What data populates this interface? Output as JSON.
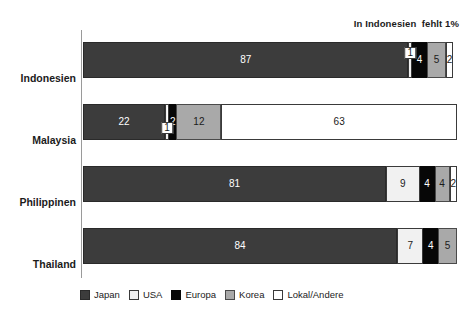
{
  "annotation": "In Indonesien  fehlt 1%",
  "chart_data": {
    "type": "bar",
    "orientation": "horizontal",
    "stacked": true,
    "title": "",
    "subtitle": "",
    "xlabel": "",
    "ylabel": "",
    "xlim": [
      0,
      100
    ],
    "grid": false,
    "legend_position": "bottom",
    "annotations": [
      "In Indonesien  fehlt 1%"
    ],
    "categories": [
      "Indonesien",
      "Malaysia",
      "Philippinen",
      "Thailand"
    ],
    "series": [
      {
        "name": "Japan",
        "color": "#3c3c3c",
        "values": [
          87,
          22,
          81,
          84
        ]
      },
      {
        "name": "USA",
        "color": "#f1f1f1",
        "values": [
          1,
          1,
          9,
          7
        ]
      },
      {
        "name": "Europa",
        "color": "#070707",
        "values": [
          4,
          2,
          4,
          4
        ]
      },
      {
        "name": "Korea",
        "color": "#a9a9a9",
        "values": [
          5,
          12,
          4,
          5
        ]
      },
      {
        "name": "Lokal/Andere",
        "color": "#ffffff",
        "values": [
          2,
          63,
          2,
          0
        ]
      }
    ]
  },
  "bars": [
    {
      "category": "Indonesien",
      "segments": [
        {
          "series": "Japan",
          "value": "87",
          "show": true,
          "callout": false
        },
        {
          "series": "USA",
          "value": "1",
          "show": true,
          "callout": true,
          "callout_up": true
        },
        {
          "series": "Europa",
          "value": "4",
          "show": true,
          "callout": false
        },
        {
          "series": "Korea",
          "value": "5",
          "show": true,
          "callout": false
        },
        {
          "series": "Lokal/Andere",
          "value": "2",
          "show": true,
          "callout": false
        }
      ]
    },
    {
      "category": "Malaysia",
      "segments": [
        {
          "series": "Japan",
          "value": "22",
          "show": true,
          "callout": false
        },
        {
          "series": "USA",
          "value": "1",
          "show": true,
          "callout": true,
          "callout_up": false
        },
        {
          "series": "Europa",
          "value": "2",
          "show": true,
          "callout": false
        },
        {
          "series": "Korea",
          "value": "12",
          "show": true,
          "callout": false
        },
        {
          "series": "Lokal/Andere",
          "value": "63",
          "show": true,
          "callout": false
        }
      ]
    },
    {
      "category": "Philippinen",
      "segments": [
        {
          "series": "Japan",
          "value": "81",
          "show": true,
          "callout": false
        },
        {
          "series": "USA",
          "value": "9",
          "show": true,
          "callout": false
        },
        {
          "series": "Europa",
          "value": "4",
          "show": true,
          "callout": false
        },
        {
          "series": "Korea",
          "value": "4",
          "show": true,
          "callout": false
        },
        {
          "series": "Lokal/Andere",
          "value": "2",
          "show": true,
          "callout": false
        }
      ]
    },
    {
      "category": "Thailand",
      "segments": [
        {
          "series": "Japan",
          "value": "84",
          "show": true,
          "callout": false
        },
        {
          "series": "USA",
          "value": "7",
          "show": true,
          "callout": false
        },
        {
          "series": "Europa",
          "value": "4",
          "show": true,
          "callout": false
        },
        {
          "series": "Korea",
          "value": "5",
          "show": true,
          "callout": false
        },
        {
          "series": "Lokal/Andere",
          "value": "",
          "show": false,
          "callout": false
        }
      ]
    }
  ],
  "legend": {
    "items": [
      {
        "label": "Japan",
        "key": "japan"
      },
      {
        "label": "USA",
        "key": "usa"
      },
      {
        "label": "Europa",
        "key": "europa"
      },
      {
        "label": "Korea",
        "key": "korea"
      },
      {
        "label": "Lokal/Andere",
        "key": "lokal"
      }
    ]
  }
}
